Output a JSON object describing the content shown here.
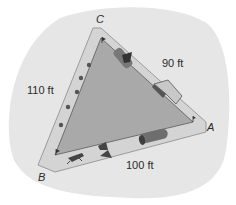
{
  "diagram": {
    "vertices": [
      {
        "name": "C",
        "x": 99,
        "y": 22
      },
      {
        "name": "A",
        "x": 210,
        "y": 131
      },
      {
        "name": "B",
        "x": 40,
        "y": 180
      }
    ],
    "sides": [
      {
        "between": "C-A",
        "label": "90 ft",
        "x": 173,
        "y": 67
      },
      {
        "between": "C-B",
        "label": "110 ft",
        "x": 28,
        "y": 94
      },
      {
        "between": "B-A",
        "label": "100 ft",
        "x": 127,
        "y": 169
      }
    ],
    "colors": {
      "background_blob": "#e6e6e6",
      "path": "#d4d4d4",
      "path_edge": "#8a8a8a",
      "field": "#a9a9a9",
      "field_edge": "#5a5a5a",
      "obstacle": "#555555",
      "obstacle_light": "#9a9a9a"
    },
    "obstacles": [
      {
        "type": "tunnel",
        "side": "C-A"
      },
      {
        "type": "ramp",
        "side": "C-A"
      },
      {
        "type": "tunnel",
        "side": "B-A"
      },
      {
        "type": "cones",
        "side": "C-B",
        "count": 5
      },
      {
        "type": "jump",
        "side": "B-A"
      },
      {
        "type": "dog",
        "side": "B-A"
      }
    ]
  }
}
